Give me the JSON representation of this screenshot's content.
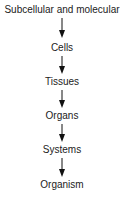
{
  "diagram": {
    "type": "hierarchy-flow",
    "direction": "top-to-bottom",
    "levels": [
      {
        "label": "Subcellular and molecular"
      },
      {
        "label": "Cells"
      },
      {
        "label": "Tissues"
      },
      {
        "label": "Organs"
      },
      {
        "label": "Systems"
      },
      {
        "label": "Organism"
      }
    ],
    "arrow_color": "#111111",
    "text_color": "#222222"
  }
}
